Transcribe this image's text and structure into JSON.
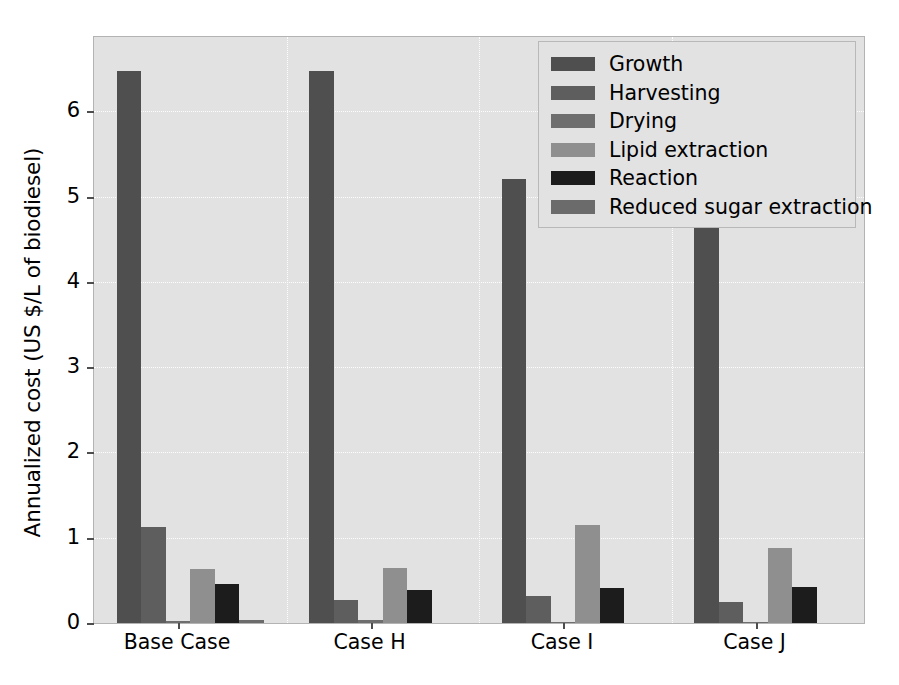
{
  "chart_data": {
    "type": "bar",
    "title": "",
    "xlabel": "",
    "ylabel": "Annualized cost (US $/L of biodiesel)",
    "categories": [
      "Base Case",
      "Case H",
      "Case I",
      "Case J"
    ],
    "ylim": [
      0,
      6.87
    ],
    "yticks": [
      0,
      1,
      2,
      3,
      4,
      5,
      6
    ],
    "ytick_labels": [
      "0",
      "1",
      "2",
      "3",
      "4",
      "5",
      "6"
    ],
    "grid": true,
    "legend_position": "upper right",
    "series": [
      {
        "name": "Growth",
        "color": "#4f4f4f",
        "values": [
          6.47,
          6.47,
          5.21,
          5.18
        ]
      },
      {
        "name": "Harvesting",
        "color": "#5e5e5e",
        "values": [
          1.12,
          0.27,
          0.32,
          0.25
        ]
      },
      {
        "name": "Drying",
        "color": "#6e6e6e",
        "values": [
          0.02,
          0.04,
          0.01,
          0.01
        ]
      },
      {
        "name": "Lipid extraction",
        "color": "#8f8f8f",
        "values": [
          0.63,
          0.65,
          1.15,
          0.88
        ]
      },
      {
        "name": "Reaction",
        "color": "#1c1c1c",
        "values": [
          0.46,
          0.39,
          0.41,
          0.42
        ]
      },
      {
        "name": "Reduced sugar extraction",
        "color": "#6b6b6b",
        "values": [
          0.03,
          0.0,
          0.0,
          0.0
        ]
      }
    ]
  },
  "axes": {
    "ylabel": "Annualized cost (US $/L of biodiesel)",
    "ytick_labels": [
      "0",
      "1",
      "2",
      "3",
      "4",
      "5",
      "6"
    ],
    "xtick_labels": [
      "Base Case",
      "Case H",
      "Case I",
      "Case J"
    ]
  },
  "legend": {
    "items": [
      {
        "label": "Growth",
        "color": "#4f4f4f"
      },
      {
        "label": "Harvesting",
        "color": "#5e5e5e"
      },
      {
        "label": "Drying",
        "color": "#6e6e6e"
      },
      {
        "label": "Lipid extraction",
        "color": "#8f8f8f"
      },
      {
        "label": "Reaction",
        "color": "#1c1c1c"
      },
      {
        "label": "Reduced sugar extraction",
        "color": "#6b6b6b"
      }
    ]
  },
  "style": {
    "plot_background": "#e2e2e2",
    "figure_background": "#ffffff",
    "grid_color": "#ffffff",
    "axis_color": "#b3b3b3"
  }
}
